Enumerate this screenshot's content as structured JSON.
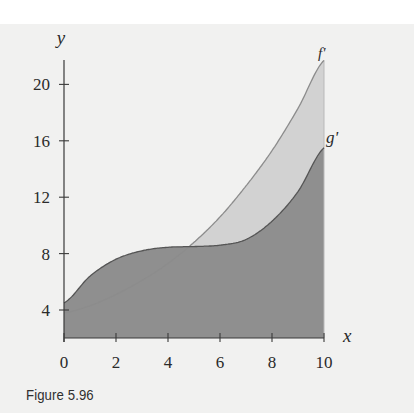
{
  "caption": "Figure 5.96",
  "colors": {
    "background": "#f1f1f0",
    "g_fill": "#8f8f8f",
    "between_fill": "#d2d2d2",
    "f_curve": "#8c8c8c",
    "g_curve": "#555555",
    "axis": "#3a3a3a"
  },
  "chart_data": {
    "type": "area",
    "title": "",
    "xlabel": "x",
    "ylabel": "y",
    "x_ticks": [
      0,
      2,
      4,
      6,
      8,
      10
    ],
    "y_ticks": [
      4,
      8,
      12,
      16,
      20
    ],
    "xlim": [
      0,
      10
    ],
    "ylim": [
      2,
      22
    ],
    "grid": false,
    "legend": "curve labels at right end",
    "x": [
      0,
      1,
      2,
      3,
      4,
      5,
      6,
      7,
      8,
      9,
      10
    ],
    "series": [
      {
        "name": "f'",
        "values": [
          3.8,
          4.3,
          5.1,
          6.1,
          7.3,
          8.8,
          10.6,
          12.8,
          15.3,
          18.3,
          21.7
        ]
      },
      {
        "name": "g'",
        "values": [
          4.5,
          6.4,
          7.6,
          8.2,
          8.45,
          8.5,
          8.6,
          9.0,
          10.3,
          12.4,
          15.5
        ]
      }
    ],
    "annotations": [
      {
        "text": "f'",
        "x": 10,
        "y": 22.4
      },
      {
        "text": "g'",
        "x": 10.1,
        "y": 16.7
      }
    ],
    "shading": "region under g' dark gray; region between f' and g' (x>~4.9) light gray"
  },
  "axes": {
    "x_label": "x",
    "y_label": "y",
    "x_tick_labels": [
      "0",
      "2",
      "4",
      "6",
      "8",
      "10"
    ],
    "y_tick_labels": [
      "4",
      "8",
      "12",
      "16",
      "20"
    ]
  },
  "labels": {
    "f": "f'",
    "g": "g'"
  }
}
